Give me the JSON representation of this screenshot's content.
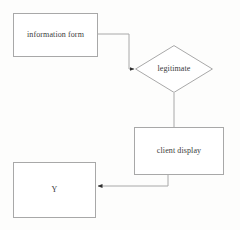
{
  "diagram": {
    "background_color": "#fdfdfc",
    "line_color": "#a8a8a8",
    "text_color": "#3a3a3a",
    "nodes": [
      {
        "id": "information-form",
        "label": "information form",
        "shape": "rectangle",
        "x": 13,
        "y": 13,
        "w": 85,
        "h": 44
      },
      {
        "id": "legitimate",
        "label": "legitimate",
        "shape": "diamond",
        "x": 135,
        "y": 45,
        "w": 78,
        "h": 48
      },
      {
        "id": "client-display",
        "label": "client display",
        "shape": "rectangle",
        "x": 134,
        "y": 127,
        "w": 90,
        "h": 48
      },
      {
        "id": "y",
        "label": "Y",
        "shape": "rectangle",
        "x": 13,
        "y": 162,
        "w": 83,
        "h": 56
      }
    ],
    "edges": [
      {
        "id": "edge-information-form-to-legitimate",
        "from": "information-form",
        "to": "legitimate",
        "label": "",
        "arrowhead": "target"
      },
      {
        "id": "edge-legitimate-to-client-display",
        "from": "legitimate",
        "to": "client-display",
        "label": "",
        "arrowhead": "none"
      },
      {
        "id": "edge-client-display-to-y",
        "from": "client-display",
        "to": "y",
        "label": "",
        "arrowhead": "target"
      }
    ]
  }
}
